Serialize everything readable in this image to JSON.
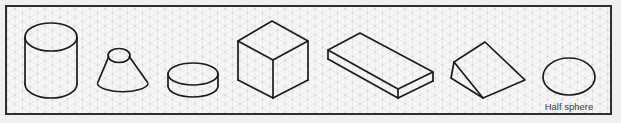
{
  "canvas": {
    "width": 621,
    "height": 123
  },
  "colors": {
    "outer_bg": "#f0f0f0",
    "panel_bg": "#f7f7f7",
    "border": "#2f2f2f",
    "grid_line": "#d9d9d9",
    "grid_dot": "#bdbdbd",
    "shape_stroke": "#1c1c1c",
    "label_text": "#3a3a3a"
  },
  "style": {
    "stroke_width": 1.7
  },
  "labels": {
    "half_sphere": "Half sphere"
  },
  "shapes": [
    {
      "name": "cylinder",
      "elements": [
        {
          "type": "ellipse",
          "cx": 51,
          "cy": 37,
          "rx": 26,
          "ry": 14
        },
        {
          "type": "path",
          "d": "M 25 84 A 26 14 0 0 0 77 84"
        },
        {
          "type": "line",
          "x1": 25,
          "y1": 37,
          "x2": 25,
          "y2": 84
        },
        {
          "type": "line",
          "x1": 77,
          "y1": 37,
          "x2": 77,
          "y2": 84
        }
      ]
    },
    {
      "name": "truncated-cone",
      "elements": [
        {
          "type": "ellipse",
          "cx": 119,
          "cy": 55.5,
          "rx": 11,
          "ry": 7
        },
        {
          "type": "path",
          "d": "M 97.5 84 A 25.5 9 0 0 0 148 84"
        },
        {
          "type": "line",
          "x1": 108.6,
          "y1": 56.8,
          "x2": 97.8,
          "y2": 82.5
        },
        {
          "type": "line",
          "x1": 129.4,
          "y1": 56.8,
          "x2": 147.6,
          "y2": 82.5
        }
      ]
    },
    {
      "name": "disc",
      "elements": [
        {
          "type": "ellipse",
          "cx": 193,
          "cy": 74,
          "rx": 25,
          "ry": 11
        },
        {
          "type": "path",
          "d": "M 168 86 A 25 11 0 0 0 218 86"
        },
        {
          "type": "line",
          "x1": 168,
          "y1": 74,
          "x2": 168,
          "y2": 86
        },
        {
          "type": "line",
          "x1": 218,
          "y1": 74,
          "x2": 218,
          "y2": 86
        }
      ]
    },
    {
      "name": "cube",
      "elements": [
        {
          "type": "polygon",
          "points": "272,21 238,41 273,60 308,41"
        },
        {
          "type": "line",
          "x1": 238,
          "y1": 41,
          "x2": 238,
          "y2": 80
        },
        {
          "type": "line",
          "x1": 273,
          "y1": 60,
          "x2": 273,
          "y2": 98
        },
        {
          "type": "line",
          "x1": 308,
          "y1": 41,
          "x2": 308,
          "y2": 80
        },
        {
          "type": "line",
          "x1": 238,
          "y1": 80,
          "x2": 273,
          "y2": 98
        },
        {
          "type": "line",
          "x1": 308,
          "y1": 80,
          "x2": 273,
          "y2": 98
        }
      ]
    },
    {
      "name": "rectangular-slab",
      "elements": [
        {
          "type": "polygon",
          "points": "328,50 360,33 433,72 398,89"
        },
        {
          "type": "line",
          "x1": 328,
          "y1": 50,
          "x2": 328,
          "y2": 59
        },
        {
          "type": "line",
          "x1": 398,
          "y1": 89,
          "x2": 398,
          "y2": 98
        },
        {
          "type": "line",
          "x1": 433,
          "y1": 72,
          "x2": 433,
          "y2": 81
        },
        {
          "type": "line",
          "x1": 328,
          "y1": 59,
          "x2": 398,
          "y2": 98
        },
        {
          "type": "line",
          "x1": 433,
          "y1": 81,
          "x2": 398,
          "y2": 98
        }
      ]
    },
    {
      "name": "wedge",
      "elements": [
        {
          "type": "polygon",
          "points": "485,42 525,80 483,98 451,78 454,62"
        },
        {
          "type": "line",
          "x1": 454,
          "y1": 62,
          "x2": 483,
          "y2": 98
        }
      ]
    },
    {
      "name": "half-sphere",
      "elements": [
        {
          "type": "path",
          "d": "M 543 77 A 26 19 0 0 1 595 77 A 26 18 0 0 1 543 77 Z"
        },
        {
          "type": "text",
          "x": 569,
          "y": 110,
          "size": 9.5,
          "text": "Half sphere"
        }
      ]
    }
  ]
}
